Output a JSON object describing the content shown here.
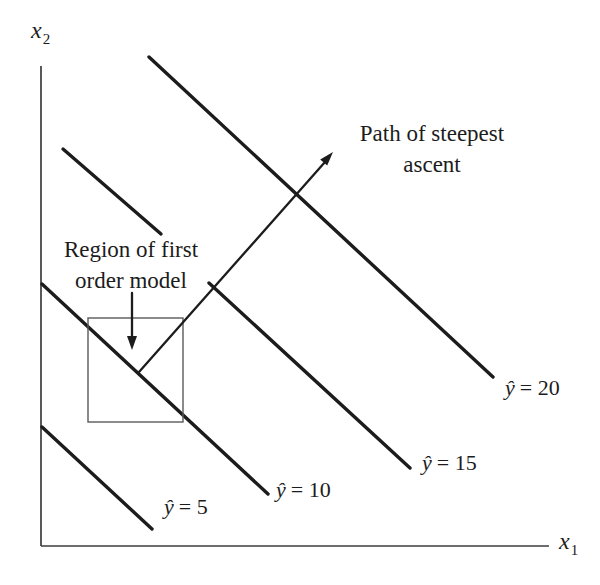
{
  "axes": {
    "x1": {
      "base": "x",
      "sub": "1"
    },
    "x2": {
      "base": "x",
      "sub": "2"
    }
  },
  "annotations": {
    "path": {
      "line1": "Path of steepest",
      "line2": "ascent"
    },
    "region": {
      "line1": "Region of first",
      "line2": "order model"
    }
  },
  "contours": [
    {
      "name": "yhat-5",
      "yhat": "ŷ",
      "eq": "= 5"
    },
    {
      "name": "yhat-10",
      "yhat": "ŷ",
      "eq": "= 10"
    },
    {
      "name": "yhat-15",
      "yhat": "ŷ",
      "eq": "= 15"
    },
    {
      "name": "yhat-20",
      "yhat": "ŷ",
      "eq": "= 20"
    }
  ],
  "colors": {
    "ink": "#1c1c1c",
    "axis": "#3c3c3c",
    "region_box": "#5a5a5a",
    "background": "#ffffff"
  }
}
